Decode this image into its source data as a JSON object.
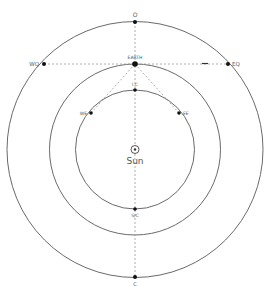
{
  "diagram": {
    "center_label": "Sun",
    "planet_label": "EARTH",
    "points": {
      "opposition": "O",
      "western_quadrature": "WQ",
      "eastern_quadrature": "EQ",
      "inferior_conjunction": "I.C",
      "greatest_western_elongation": "WE",
      "greatest_eastern_elongation": "EE",
      "superior_conjunction": "S/C",
      "conjunction": "C"
    },
    "colors": {
      "orbit": "#6a6a6a",
      "dashed": "#9a9a9a",
      "point": "#111111",
      "label": "#555555"
    }
  }
}
